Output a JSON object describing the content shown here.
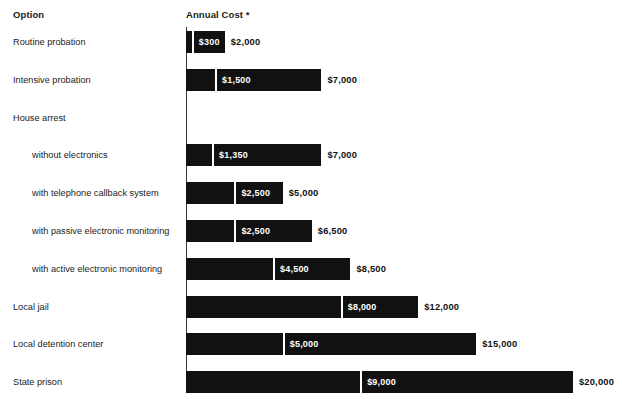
{
  "header": {
    "option_label": "Option",
    "cost_label": "Annual Cost *"
  },
  "chart_data": {
    "type": "bar",
    "subtype": "horizontal-range-bar",
    "title": "",
    "xlabel": "Annual Cost *",
    "ylabel": "Option",
    "grid": false,
    "legend": false,
    "axis_origin_value": 0,
    "xlim": [
      0,
      20000
    ],
    "value_prefix": "$",
    "categories": [
      "Routine probation",
      "Intensive probation",
      "House arrest",
      "without electronics",
      "with telephone callback system",
      "with passive electronic monitoring",
      "with active electronic monitoring",
      "Local jail",
      "Local detention center",
      "State prison"
    ],
    "series": [
      {
        "name": "Low estimate",
        "values": [
          300,
          1500,
          null,
          1350,
          2500,
          2500,
          4500,
          8000,
          5000,
          9000
        ]
      },
      {
        "name": "High estimate",
        "values": [
          2000,
          7000,
          null,
          7000,
          5000,
          6500,
          8500,
          12000,
          15000,
          20000
        ]
      }
    ],
    "rows": [
      {
        "label": "Routine probation",
        "indent": 0,
        "has_bar": true,
        "low": 300,
        "high": 2000,
        "low_text": "$300",
        "high_text": "$2,000"
      },
      {
        "label": "Intensive probation",
        "indent": 0,
        "has_bar": true,
        "low": 1500,
        "high": 7000,
        "low_text": "$1,500",
        "high_text": "$7,000"
      },
      {
        "label": "House arrest",
        "indent": 0,
        "has_bar": false,
        "low": null,
        "high": null,
        "low_text": "",
        "high_text": ""
      },
      {
        "label": "without electronics",
        "indent": 1,
        "has_bar": true,
        "low": 1350,
        "high": 7000,
        "low_text": "$1,350",
        "high_text": "$7,000"
      },
      {
        "label": "with telephone callback system",
        "indent": 1,
        "has_bar": true,
        "low": 2500,
        "high": 5000,
        "low_text": "$2,500",
        "high_text": "$5,000"
      },
      {
        "label": "with passive electronic monitoring",
        "indent": 1,
        "has_bar": true,
        "low": 2500,
        "high": 6500,
        "low_text": "$2,500",
        "high_text": "$6,500"
      },
      {
        "label": "with active electronic monitoring",
        "indent": 1,
        "has_bar": true,
        "low": 4500,
        "high": 8500,
        "low_text": "$4,500",
        "high_text": "$8,500"
      },
      {
        "label": "Local jail",
        "indent": 0,
        "has_bar": true,
        "low": 8000,
        "high": 12000,
        "low_text": "$8,000",
        "high_text": "$12,000"
      },
      {
        "label": "Local detention center",
        "indent": 0,
        "has_bar": true,
        "low": 5000,
        "high": 15000,
        "low_text": "$5,000",
        "high_text": "$15,000"
      },
      {
        "label": "State prison",
        "indent": 0,
        "has_bar": true,
        "low": 9000,
        "high": 20000,
        "low_text": "$9,000",
        "high_text": "$20,000"
      }
    ]
  },
  "layout": {
    "axis_x": 186,
    "px_per_1000": 19.35,
    "bar_height": 22,
    "row_pitch": 37.8,
    "first_bar_top": 31,
    "label_x_top": 13,
    "label_x_indent": 32,
    "bar_color": "#111111",
    "divider_color": "#ffffff",
    "text_color": "#1a1a1a"
  }
}
